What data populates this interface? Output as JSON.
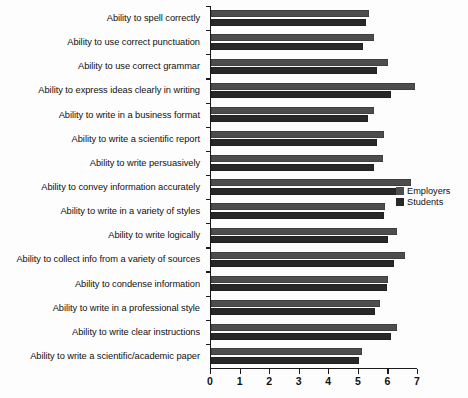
{
  "chart_data": {
    "type": "bar",
    "orientation": "horizontal",
    "title": "",
    "xlabel": "",
    "ylabel": "",
    "xlim": [
      0,
      7
    ],
    "xticks": [
      0,
      1,
      2,
      3,
      4,
      5,
      6,
      7
    ],
    "xtick_labels": [
      "0",
      "1",
      "2",
      "3",
      "4",
      "5",
      "6",
      "7"
    ],
    "grid": false,
    "legend_position": "right-middle",
    "categories": [
      "Ability to spell correctly",
      "Ability to use correct punctuation",
      "Ability to use correct grammar",
      "Ability to express ideas clearly in writing",
      "Ability to write in a business format",
      "Ability to write a scientific report",
      "Ability to write persuasively",
      "Ability to convey information accurately",
      "Ability to write in a variety of styles",
      "Ability to write logically",
      "Ability to collect info from a variety of sources",
      "Ability to condense information",
      "Ability to write in a professional style",
      "Ability to write clear instructions",
      "Ability to write a scientific/academic paper"
    ],
    "series": [
      {
        "name": "Employers",
        "color": "#4d4d4d",
        "values": [
          5.35,
          5.5,
          6.0,
          6.9,
          5.5,
          5.85,
          5.8,
          6.75,
          5.9,
          6.3,
          6.55,
          6.0,
          5.7,
          6.3,
          5.1
        ]
      },
      {
        "name": "Students",
        "color": "#282828",
        "values": [
          5.25,
          5.15,
          5.6,
          6.1,
          5.3,
          5.6,
          5.5,
          6.3,
          5.85,
          6.0,
          6.2,
          5.95,
          5.55,
          6.1,
          5.0
        ]
      }
    ]
  },
  "legend": {
    "items": [
      {
        "label": "Employers"
      },
      {
        "label": "Students"
      }
    ]
  }
}
